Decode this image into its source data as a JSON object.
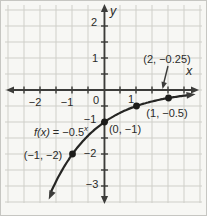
{
  "chart_data": {
    "type": "line",
    "title": "",
    "xlabel": "x",
    "ylabel": "y",
    "xlim": [
      -3,
      3
    ],
    "ylim": [
      -3.7,
      2.6
    ],
    "grid": true,
    "grid_step": 0.5,
    "x_ticks": [
      {
        "value": -2,
        "label": "−2"
      },
      {
        "value": -1,
        "label": "−1"
      },
      {
        "value": 0,
        "label": "0"
      },
      {
        "value": 1,
        "label": "1"
      }
    ],
    "y_ticks": [
      {
        "value": 2,
        "label": "2"
      },
      {
        "value": 1,
        "label": "1"
      },
      {
        "value": -1,
        "label": "−1"
      },
      {
        "value": -2,
        "label": "−2"
      },
      {
        "value": -3,
        "label": "−3"
      }
    ],
    "function_label": {
      "name": "f(x)",
      "eq": " = ",
      "base": "−0.5",
      "exponent": "x"
    },
    "curve": {
      "formula": "f(x) = −0.5^x",
      "coefficient": -1,
      "base": 0.5,
      "x_start": -1.68,
      "x_end": 2.72
    },
    "series": [
      {
        "name": "f(x) = −0.5^x",
        "points": [
          {
            "x": -1,
            "y": -2,
            "label": "(−1, −2)"
          },
          {
            "x": 0,
            "y": -1,
            "label": "(0, −1)"
          },
          {
            "x": 1,
            "y": -0.5,
            "label": "(1, −0.5)"
          },
          {
            "x": 2,
            "y": -0.25,
            "label": "(2, −0.25)"
          }
        ]
      }
    ],
    "colors": {
      "background": "#f7f7f4",
      "grid": "#cfcfc9",
      "axis": "#3c3c3a",
      "curve": "#262624",
      "point": "#1c1c1a",
      "text": "#2a2a28"
    }
  }
}
